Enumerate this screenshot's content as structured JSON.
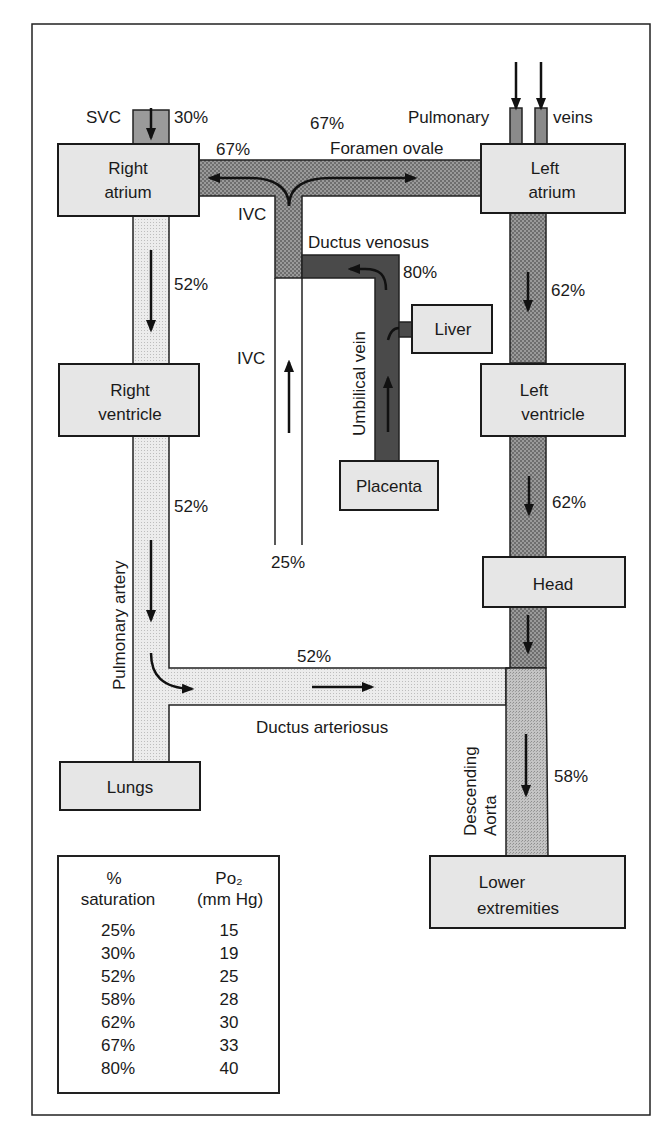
{
  "colors": {
    "box_fill": "#e6e6e6",
    "outline": "#1a1a1a",
    "sat_80": "#4a4a4a",
    "sat_67_62": "#8c8c8c",
    "sat_58": "#b0b0b0",
    "sat_52": "#e0e0e0",
    "sat_30": "#9a9a9a"
  },
  "structures": {
    "right_atrium": [
      "Right",
      "atrium"
    ],
    "left_atrium": [
      "Left",
      "atrium"
    ],
    "right_ventricle": [
      "Right",
      "ventricle"
    ],
    "left_ventricle": [
      "Left",
      "ventricle"
    ],
    "liver": "Liver",
    "placenta": "Placenta",
    "head": "Head",
    "lungs": "Lungs",
    "lower_extremities": [
      "Lower",
      "extremities"
    ]
  },
  "vessels": {
    "svc": "SVC",
    "ivc_upper": "IVC",
    "ivc_lower": "IVC",
    "pulmonary_veins_left": "Pulmonary",
    "pulmonary_veins_right": "veins",
    "foramen_ovale": "Foramen ovale",
    "ductus_venosus": "Ductus venosus",
    "umbilical_vein": "Umbilical vein",
    "pulmonary_artery": "Pulmonary artery",
    "ductus_arteriosus": "Ductus arteriosus",
    "descending_aorta": [
      "Descending",
      "Aorta"
    ]
  },
  "saturations": {
    "svc": "30%",
    "foramen_right": "67%",
    "foramen_top": "67%",
    "ductus_venosus": "80%",
    "ra_to_rv": "52%",
    "la_to_lv": "62%",
    "pulmonary_artery": "52%",
    "ivc_lower": "25%",
    "lv_to_head": "62%",
    "ductus_arteriosus": "52%",
    "descending_aorta": "58%"
  },
  "legend": {
    "col1_header": [
      "%",
      "saturation"
    ],
    "col2_header": [
      "Po₂",
      "(mm Hg)"
    ],
    "rows": [
      {
        "saturation": "25%",
        "po2": "15"
      },
      {
        "saturation": "30%",
        "po2": "19"
      },
      {
        "saturation": "52%",
        "po2": "25"
      },
      {
        "saturation": "58%",
        "po2": "28"
      },
      {
        "saturation": "62%",
        "po2": "30"
      },
      {
        "saturation": "67%",
        "po2": "33"
      },
      {
        "saturation": "80%",
        "po2": "40"
      }
    ]
  }
}
